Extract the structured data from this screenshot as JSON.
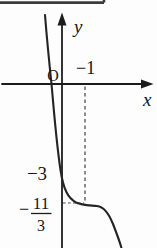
{
  "figure": {
    "background": "#fdfdfd",
    "ink_color": "#1c1c1c",
    "dash_color": "#4a4a4a",
    "frame_color": "#3c3c3c",
    "labels": {
      "y_axis": "y",
      "x_axis": "x",
      "origin": "O",
      "x_mark": "−1",
      "y_intercept": "−3",
      "frac_minus": "−",
      "frac_numerator": "11",
      "frac_denominator": "3"
    },
    "geometry": {
      "frame_corner": "M104,0 V2.6 M0,2.6 H104",
      "x_axis_line": "M2,84 H143",
      "y_axis_line": "M62,20 V248",
      "y_arrow_points": "62,12.5 57.5,25.5 66.5,25.5",
      "x_arrow_points": "153.5,84 141,79.5 141,88.5",
      "curve_path": "M45,15 C47,40 49.5,65 51.5,84 C53.5,105 56,140 60.5,170 C63.5,190 68,198 76,202.5 C82,205.5 90,205.3 97,206 C104,206.7 109,214 113,224 C116.5,233 119.5,241 121.5,248",
      "dashed_vertical": "M85,86.5 V201",
      "dashed_horizontal": "M63,203 H84",
      "fraction_bar": "M31,213.5 H51.5"
    }
  },
  "chart_data": {
    "type": "line",
    "title": "",
    "xlabel": "x",
    "ylabel": "y",
    "origin_label": "O",
    "legend": "none",
    "grid": false,
    "marked_x_values": [
      "−1"
    ],
    "marked_y_values": [
      "−3",
      "−11/3"
    ],
    "y_intercept": -3,
    "x_intercept_approx": -0.45,
    "stationary_point": {
      "x_label": "−1",
      "y_label": "−11/3",
      "y_value": -3.667
    },
    "guides": [
      "dashed vertical segment from x-axis mark labelled −1 down to the flat point of the curve",
      "dashed horizontal segment from y-axis at −11/3 across to the flat point of the curve"
    ],
    "curve_description": "Steeply decreasing cubic-like curve entering from upper left, crossing the x-axis just left of the origin, crossing the y-axis at −3, flattening at a stationary (saddle) point where the dashed guides meet (−11/3), then decreasing steeply again toward the lower right"
  }
}
